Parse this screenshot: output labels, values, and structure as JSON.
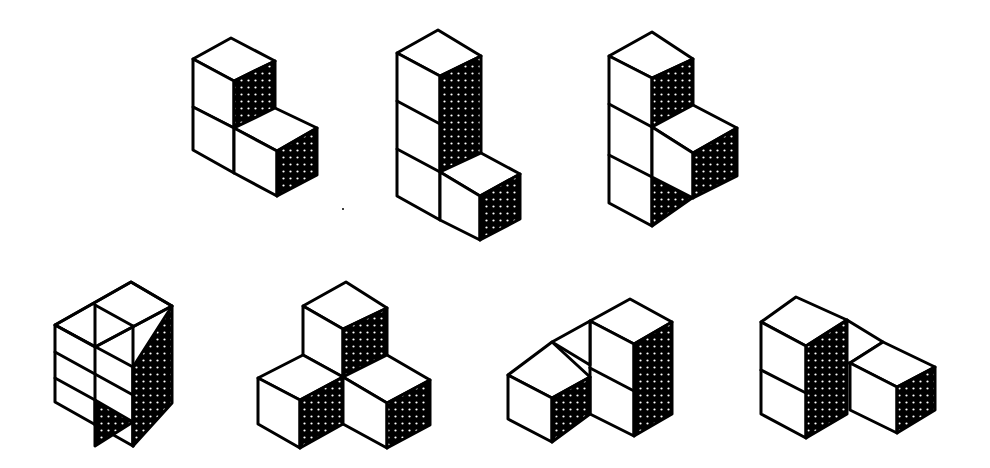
{
  "figure": {
    "background": "#ffffff",
    "ink": "#000000",
    "shade_pattern": "white dots on black",
    "pieces": [
      {
        "id": "piece-1",
        "row": 1,
        "cubes": 3,
        "shape": "L-tricube (2 high column + 1 front-right)"
      },
      {
        "id": "piece-2",
        "row": 1,
        "cubes": 4,
        "shape": "L-tetracube (3 high column + 1 front-right)"
      },
      {
        "id": "piece-3",
        "row": 1,
        "cubes": 4,
        "shape": "T-tetracube (3 high column + 1 middle front-right)"
      },
      {
        "id": "piece-4",
        "row": 2,
        "cubes": 4,
        "shape": "2x2 square tetracube standing"
      },
      {
        "id": "piece-5",
        "row": 2,
        "cubes": 4,
        "shape": "tripod corner tetracube"
      },
      {
        "id": "piece-6",
        "row": 2,
        "cubes": 4,
        "shape": "skew tetracube (2 high + 1 back + 1 front-left)"
      },
      {
        "id": "piece-7",
        "row": 2,
        "cubes": 4,
        "shape": "skew tetracube (2 high + 1 back + 1 front-right)"
      }
    ]
  }
}
